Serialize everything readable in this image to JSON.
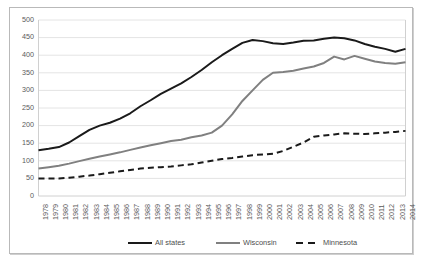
{
  "chart_data": {
    "type": "line",
    "title": "",
    "xlabel": "",
    "ylabel": "",
    "ylim": [
      0,
      500
    ],
    "ytick_step": 50,
    "yticks": [
      0,
      50,
      100,
      150,
      200,
      250,
      300,
      350,
      400,
      450,
      500
    ],
    "grid": true,
    "legend_position": "bottom",
    "categories": [
      "1978",
      "1979",
      "1980",
      "1981",
      "1982",
      "1983",
      "1984",
      "1985",
      "1986",
      "1987",
      "1988",
      "1989",
      "1990",
      "1991",
      "1992",
      "1993",
      "1994",
      "1995",
      "1996",
      "1997",
      "1998",
      "1999",
      "2000",
      "2001",
      "2002",
      "2003",
      "2004",
      "2005",
      "2006",
      "2007",
      "2008",
      "2009",
      "2010",
      "2011",
      "2012",
      "2013",
      "2014"
    ],
    "series": [
      {
        "name": "All states",
        "color": "#1a1a1a",
        "style": "solid",
        "width": 2.0,
        "values": [
          130,
          134,
          139,
          152,
          170,
          188,
          200,
          208,
          220,
          235,
          255,
          272,
          290,
          305,
          320,
          338,
          358,
          380,
          400,
          418,
          435,
          443,
          440,
          434,
          432,
          436,
          441,
          442,
          447,
          450,
          448,
          442,
          432,
          424,
          418,
          410,
          418
        ]
      },
      {
        "name": "Wisconsin",
        "color": "#808080",
        "style": "solid",
        "width": 2.0,
        "values": [
          78,
          82,
          86,
          92,
          99,
          106,
          112,
          118,
          124,
          131,
          138,
          144,
          150,
          156,
          160,
          167,
          172,
          180,
          200,
          232,
          270,
          300,
          330,
          350,
          352,
          356,
          362,
          368,
          378,
          396,
          388,
          398,
          390,
          382,
          378,
          376,
          380
        ]
      },
      {
        "name": "Minnesota",
        "color": "#1a1a1a",
        "style": "dashed",
        "width": 2.0,
        "values": [
          50,
          50,
          50,
          52,
          55,
          58,
          62,
          66,
          70,
          74,
          78,
          80,
          82,
          84,
          87,
          90,
          95,
          100,
          105,
          108,
          112,
          116,
          118,
          120,
          128,
          140,
          152,
          168,
          172,
          175,
          178,
          177,
          176,
          178,
          180,
          182,
          185
        ]
      }
    ]
  },
  "legend": {
    "items": [
      {
        "label": "All states"
      },
      {
        "label": "Wisconsin"
      },
      {
        "label": "Minnesota"
      }
    ]
  },
  "colors": {
    "all_states": "#1a1a1a",
    "wisconsin": "#808080",
    "minnesota": "#1a1a1a",
    "grid": "#e4e4e4",
    "axis": "#d0d0d0",
    "tick_text": "#5a5a5a",
    "frame": "#b9b9b9",
    "background": "#ffffff"
  }
}
